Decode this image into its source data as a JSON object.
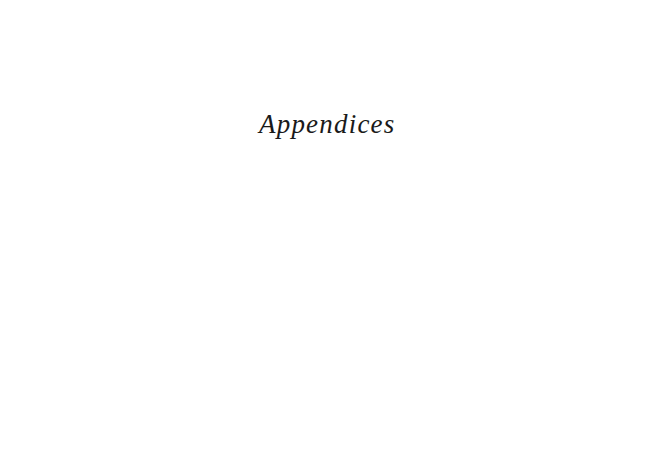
{
  "page": {
    "title": "Appendices"
  }
}
